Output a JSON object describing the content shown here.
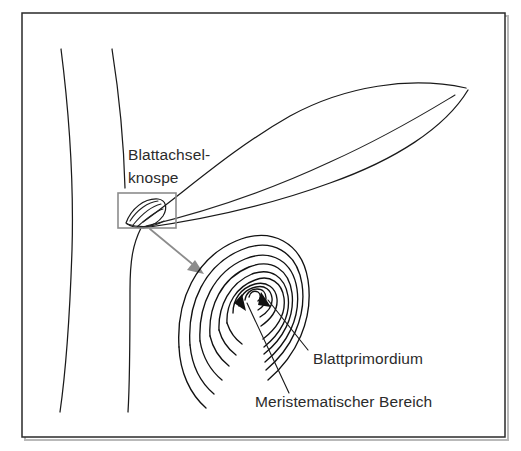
{
  "figure": {
    "title_visible": false,
    "background_color": "#ffffff",
    "frame": {
      "color": "#2a2a2a",
      "x": 22,
      "y": 13,
      "width": 483,
      "height": 424
    },
    "ink_color": "#1a1a1a",
    "accent_gray": "#8c8c8c",
    "text_color": "#2b2b2b"
  },
  "labels": [
    {
      "name": "axillary-bud-label",
      "lines": [
        "Blattachsel-",
        "knospe"
      ],
      "line1": "Blattachsel-",
      "line2": "knospe",
      "x": 128,
      "y": 160
    },
    {
      "name": "leaf-primordium-label",
      "text": "Blattprimordium",
      "x": 313,
      "y": 364
    },
    {
      "name": "meristematic-region-label",
      "text": "Meristematischer Bereich",
      "x": 255,
      "y": 407
    }
  ],
  "annotations": {
    "zoom_box": {
      "name": "axillary-bud-highlight-box",
      "x": 118,
      "y": 193,
      "width": 58,
      "height": 35,
      "color": "#8c8c8c"
    },
    "zoom_arrow": {
      "name": "magnification-arrow",
      "from_x": 150,
      "from_y": 229,
      "to_x": 202,
      "to_y": 272,
      "color": "#8c8c8c"
    },
    "leaders": [
      {
        "name": "leader-blattprimordium",
        "from_x": 308,
        "from_y": 350,
        "to_x": 263,
        "to_y": 295
      },
      {
        "name": "leader-meristematischer-bereich",
        "from_x": 288,
        "from_y": 392,
        "to_x": 242,
        "to_y": 296
      }
    ]
  },
  "structures": {
    "stem": {
      "name": "plant-stem",
      "line_count": 2
    },
    "leaf": {
      "name": "leaf-blade",
      "has_midrib": true
    },
    "bud": {
      "name": "axillary-bud",
      "shape": "lens"
    },
    "meristem": {
      "name": "shoot-apical-meristem-spiral",
      "arc_count": 9
    }
  }
}
